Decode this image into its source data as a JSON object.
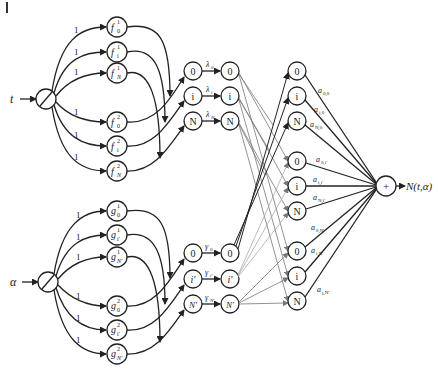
{
  "diagram": {
    "corner_mark": "|",
    "inputs": [
      {
        "id": "t",
        "label": "t"
      },
      {
        "id": "alpha",
        "label": "α"
      }
    ],
    "edge_weight_label": "1",
    "f_nodes": [
      {
        "base": "f",
        "sub": "0",
        "sup": "1"
      },
      {
        "base": "f",
        "sub": "i",
        "sup": "1"
      },
      {
        "base": "f",
        "sub": "N",
        "sup": "1"
      },
      {
        "base": "f",
        "sub": "0",
        "sup": "2"
      },
      {
        "base": "f",
        "sub": "i",
        "sup": "2"
      },
      {
        "base": "f",
        "sub": "N",
        "sup": "2"
      }
    ],
    "g_nodes": [
      {
        "base": "g",
        "sub": "0",
        "sup": "1"
      },
      {
        "base": "g",
        "sub": "i'",
        "sup": "1"
      },
      {
        "base": "g",
        "sub": "N'",
        "sup": "1"
      },
      {
        "base": "g",
        "sub": "0",
        "sup": "2"
      },
      {
        "base": "g",
        "sub": "i'",
        "sup": "2"
      },
      {
        "base": "g",
        "sub": "N'",
        "sup": "2"
      }
    ],
    "t_product_nodes": [
      "0",
      "i",
      "N"
    ],
    "t_weights": [
      {
        "base": "λ",
        "sub": "0"
      },
      {
        "base": "λ",
        "sub": "i"
      },
      {
        "base": "λ",
        "sub": "N"
      }
    ],
    "t_out_nodes": [
      "0",
      "i",
      "N"
    ],
    "alpha_product_nodes": [
      "0",
      "i'",
      "N'"
    ],
    "alpha_weights": [
      {
        "base": "γ",
        "sub": "0"
      },
      {
        "base": "γ",
        "sub": "i'"
      },
      {
        "base": "γ",
        "sub": "N'"
      }
    ],
    "alpha_out_nodes": [
      "0",
      "i'",
      "N'"
    ],
    "combo_nodes": [
      "0",
      "i",
      "N",
      "0",
      "i",
      "N",
      "0",
      "i",
      "N"
    ],
    "output_weights": [
      {
        "base": "a",
        "sub": "0,0"
      },
      {
        "base": "a",
        "sub": "i,0"
      },
      {
        "base": "a",
        "sub": "N,0"
      },
      {
        "base": "a",
        "sub": "0,i'"
      },
      {
        "base": "a",
        "sub": "i,i'"
      },
      {
        "base": "a",
        "sub": "N,i'"
      },
      {
        "base": "a",
        "sub": "0,N'"
      },
      {
        "base": "a",
        "sub": "i,N'"
      },
      {
        "base": "a",
        "sub": "j,N'"
      }
    ],
    "sum_node": "+",
    "output_label": "N(t,α)"
  }
}
